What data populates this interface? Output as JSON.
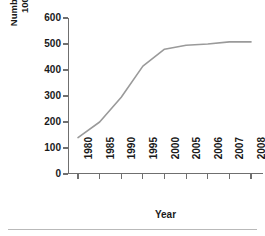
{
  "chart_data": {
    "type": "line",
    "title": "",
    "xlabel": "Year",
    "ylabel": "Number of Offenders per\n100,000 Population",
    "categories": [
      "1980",
      "1985",
      "1990",
      "1995",
      "2000",
      "2005",
      "2006",
      "2007",
      "2008"
    ],
    "values": [
      140,
      200,
      295,
      415,
      480,
      495,
      500,
      508,
      508
    ],
    "series": [
      {
        "name": "Number of Offenders per 100,000 Population",
        "values": [
          140,
          200,
          295,
          415,
          480,
          495,
          500,
          508,
          508
        ]
      }
    ],
    "ylim": [
      0,
      600
    ],
    "yticks": [
      0,
      100,
      200,
      300,
      400,
      500,
      600
    ],
    "ytick_labels": [
      "0",
      "100",
      "200",
      "300",
      "400",
      "500",
      "600"
    ],
    "xtick_labels": [
      "1980",
      "1985",
      "1990",
      "1995",
      "2000",
      "2005",
      "2006",
      "2007",
      "2008"
    ],
    "grid": false,
    "legend": false,
    "legend_position": "none",
    "markers": false,
    "line_color": "#9a9a9a",
    "axis_color": "#6f6f6f",
    "background_color": "#ffffff",
    "text_color": "#1a1a1a"
  }
}
